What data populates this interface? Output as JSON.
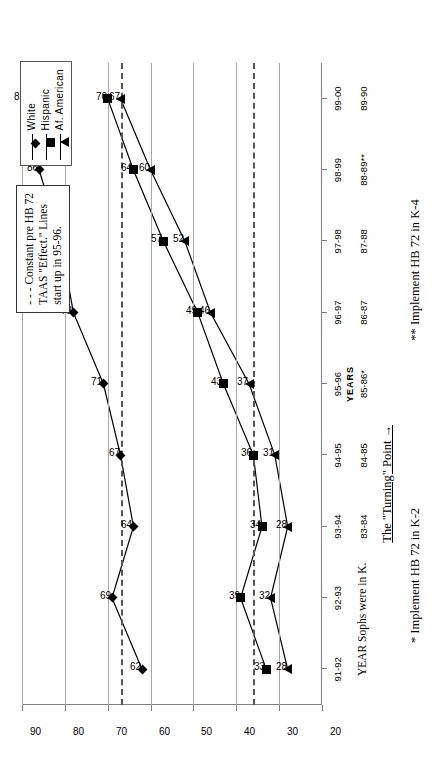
{
  "chart_data": {
    "type": "line",
    "title": "",
    "xlabel": "YEARS",
    "ylabel": "Percent Passing",
    "ylim": [
      20,
      90
    ],
    "yticks": [
      20,
      30,
      40,
      50,
      60,
      70,
      80,
      90
    ],
    "grid": true,
    "legend_position": "top-right",
    "categories": [
      "91-92",
      "92-93",
      "93-94",
      "94-95",
      "95-96",
      "96-97",
      "97-98",
      "98-99",
      "99-00"
    ],
    "categories_row2": [
      "83-84",
      "84-85",
      "85-86*",
      "86-87",
      "87-88",
      "88-89**",
      "89-90"
    ],
    "series": [
      {
        "name": "White",
        "marker": "diamond",
        "values": [
          62,
          69,
          64,
          67,
          71,
          78,
          81,
          86,
          89
        ]
      },
      {
        "name": "Hispanic",
        "marker": "square",
        "values": [
          33,
          39,
          34,
          36,
          43,
          49,
          57,
          64,
          70
        ]
      },
      {
        "name": "Af. American",
        "marker": "triangle",
        "values": [
          28,
          32,
          28,
          31,
          37,
          46,
          52,
          60,
          67
        ]
      }
    ],
    "reference_lines": [
      {
        "value": 67,
        "style": "dashed",
        "label": "Constant pre HB 72 TAAS Effect line (upper)"
      },
      {
        "value": 36,
        "style": "dashed",
        "label": "Constant pre HB 72 TAAS Effect line (lower)"
      }
    ]
  },
  "legend": {
    "items": [
      {
        "label": "White",
        "marker": "diamond"
      },
      {
        "label": "Hispanic",
        "marker": "square"
      },
      {
        "label": "Af. American",
        "marker": "triangle"
      }
    ]
  },
  "note": {
    "line1": "- - - Constant pre HB 72",
    "line2": "TAAS \"Effect.\"  Lines",
    "line3": "start up in 95-96."
  },
  "axis": {
    "years_title": "YEARS",
    "y_title": "Percent Passing",
    "row2_caption": "YEAR Sophs were in K."
  },
  "annotations": {
    "turning_point": "The \"Turning\" Point   →",
    "footnote1": "* Implement HB 72 in K-2",
    "footnote2": "** Implement HB 72 in K-4"
  }
}
